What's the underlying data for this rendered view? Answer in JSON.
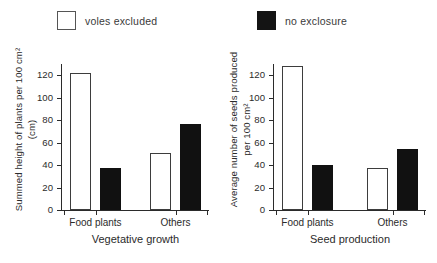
{
  "legend": {
    "entries": [
      {
        "label": "voles excluded",
        "swatch": "open-square",
        "color": "#ffffff"
      },
      {
        "label": "no exclosure",
        "swatch": "filled-square",
        "color": "#111111"
      }
    ]
  },
  "chart_data": [
    {
      "type": "bar",
      "title": "",
      "xlabel": "Vegetative growth",
      "ylabel": "Summed height of plants per 100 cm² (cm)",
      "categories": [
        "Food plants",
        "Others"
      ],
      "series": [
        {
          "name": "voles excluded",
          "values": [
            122,
            51
          ]
        },
        {
          "name": "no exclosure",
          "values": [
            37,
            77
          ]
        }
      ],
      "ylim": [
        0,
        130
      ],
      "yticks": [
        0,
        20,
        40,
        60,
        80,
        100,
        120
      ],
      "ytick_labels": [
        "0",
        "20",
        "40",
        "60",
        "80",
        "100",
        "120"
      ],
      "grid": false,
      "legend_position": "top"
    },
    {
      "type": "bar",
      "title": "",
      "xlabel": "Seed production",
      "ylabel": "Average number of seeds produced per 100 cm²",
      "categories": [
        "Food plants",
        "Others"
      ],
      "series": [
        {
          "name": "voles excluded",
          "values": [
            128,
            37
          ]
        },
        {
          "name": "no exclosure",
          "values": [
            40,
            54
          ]
        }
      ],
      "ylim": [
        0,
        130
      ],
      "yticks": [
        0,
        20,
        40,
        60,
        80,
        100,
        120
      ],
      "ytick_labels": [
        "0",
        "20",
        "40",
        "60",
        "80",
        "100",
        "120"
      ],
      "grid": false,
      "legend_position": "top"
    }
  ]
}
